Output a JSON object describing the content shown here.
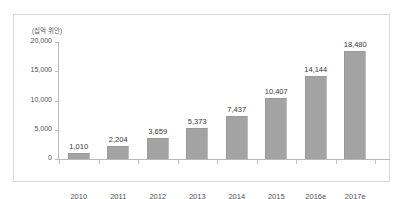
{
  "chart_data": {
    "type": "bar",
    "title": "",
    "unit_label": "(십억 위안)",
    "xlabel": "",
    "ylabel": "",
    "ylim": [
      0,
      20000
    ],
    "yticks": [
      "0",
      "5,000",
      "10,000",
      "15,000",
      "20,000"
    ],
    "ytick_values": [
      0,
      5000,
      10000,
      15000,
      20000
    ],
    "grid": false,
    "legend": false,
    "categories": [
      "2010",
      "2011",
      "2012",
      "2013",
      "2014",
      "2015",
      "2016e",
      "2017e"
    ],
    "values": [
      1010,
      2204,
      3659,
      5373,
      7437,
      10407,
      14144,
      18480
    ],
    "value_labels": [
      "1,010",
      "2,204",
      "3,659",
      "5,373",
      "7,437",
      "10,407",
      "14,144",
      "18,480"
    ],
    "bar_color": "#a3a3a3",
    "axis_color": "#b9b9b9",
    "frame_color": "#d8d8d8",
    "text_color": "#4d5154"
  }
}
